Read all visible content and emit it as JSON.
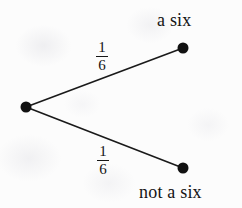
{
  "diagram": {
    "type": "probability-tree",
    "title": "",
    "background_color": "#fcfcfc",
    "ink_color": "#141414",
    "nodes": [
      {
        "id": "root",
        "name": "root-node",
        "label": "",
        "x": 26,
        "y": 107,
        "radius": 5.5
      },
      {
        "id": "six",
        "name": "a-six-node",
        "label": "a six",
        "x": 183,
        "y": 48,
        "radius": 5.5
      },
      {
        "id": "not_six",
        "name": "not-a-six-node",
        "label": "not a six",
        "x": 183,
        "y": 168,
        "radius": 5.5
      }
    ],
    "branches": [
      {
        "id": "branch-upper",
        "from": "root",
        "to": "six",
        "probability_numerator": "1",
        "probability_denominator": "6",
        "probability_text": "1/6",
        "outcome_label": "a six"
      },
      {
        "id": "branch-lower",
        "from": "root",
        "to": "not_six",
        "probability_numerator": "1",
        "probability_denominator": "6",
        "probability_text": "1/6",
        "outcome_label": "not a six"
      }
    ]
  }
}
